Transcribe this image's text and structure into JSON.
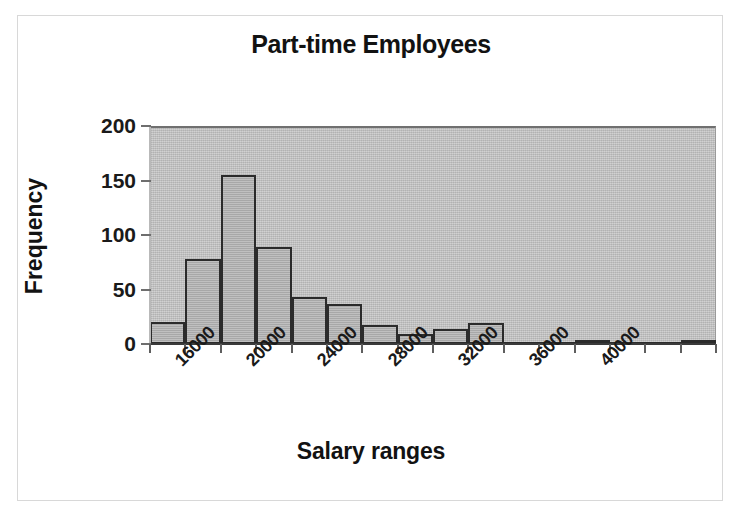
{
  "figure": {
    "background_color": "#ffffff",
    "frame_color": "#d8d8d8",
    "plot_background_color": "#c2c2c2",
    "bar_fill_color": "#b2b2b2",
    "bar_border_color": "#2b2b2b"
  },
  "chart_data": {
    "type": "bar",
    "title": "Part-time Employees",
    "subtitle": "",
    "xlabel": "Salary ranges",
    "ylabel": "Frequency",
    "categories": [
      "14000",
      "16000",
      "18000",
      "20000",
      "22000",
      "24000",
      "26000",
      "28000",
      "30000",
      "32000",
      "34000",
      "36000",
      "38000",
      "40000",
      "42000",
      "44000"
    ],
    "values": [
      20,
      78,
      155,
      89,
      43,
      37,
      17,
      9,
      14,
      19,
      2,
      2,
      3,
      0,
      0,
      3
    ],
    "bin_width": 2000,
    "x_tick_labels": [
      "16000",
      "20000",
      "24000",
      "28000",
      "32000",
      "36000",
      "40000"
    ],
    "x_tick_label_rotation": -45,
    "y_tick_labels": [
      "0",
      "50",
      "100",
      "150",
      "200"
    ],
    "y_ticks": [
      0,
      50,
      100,
      150,
      200
    ],
    "ylim": [
      0,
      200
    ],
    "grid": false,
    "legend": null,
    "legend_position": "none"
  }
}
